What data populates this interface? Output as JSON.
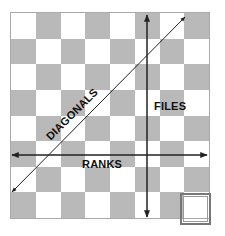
{
  "diagram": {
    "board": {
      "rows": 8,
      "cols": 8,
      "top_left_color": "light",
      "colors": {
        "light": "#ffffff",
        "dark": "#b9b9b9",
        "border": "#a9a9a9"
      }
    },
    "labels": {
      "files": "FILES",
      "ranks": "RANKS",
      "diagonals": "DIAGONALS"
    },
    "arrows": [
      {
        "name": "files-arrow",
        "direction": "vertical-both"
      },
      {
        "name": "ranks-arrow",
        "direction": "horizontal-both"
      },
      {
        "name": "diagonals-arrow",
        "direction": "diagonal-both"
      }
    ],
    "highlighted_square": {
      "row": 8,
      "col": 8
    }
  }
}
